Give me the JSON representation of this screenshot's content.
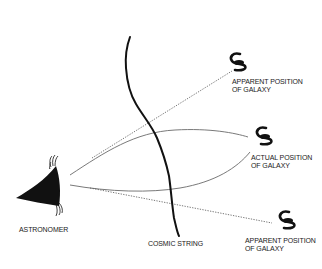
{
  "diagram": {
    "type": "gravitational-lensing-by-cosmic-string",
    "colors": {
      "ink": "#111111",
      "light_path": "#666666",
      "dotted": "#555555",
      "background": "#ffffff"
    },
    "labels": {
      "astronomer": "ASTRONOMER",
      "cosmic_string": "COSMIC STRING",
      "apparent_top": [
        "APPARENT POSITION",
        "OF GALAXY"
      ],
      "actual": [
        "ACTUAL POSITION",
        "OF GALAXY"
      ],
      "apparent_bottom": [
        "APPARENT POSITION",
        "OF GALAXY"
      ]
    },
    "nodes": [
      {
        "id": "astronomer",
        "icon": "eye-cone-icon"
      },
      {
        "id": "cosmic-string",
        "icon": "wavy-line"
      },
      {
        "id": "galaxy-apparent-top",
        "icon": "spiral-galaxy-icon"
      },
      {
        "id": "galaxy-actual",
        "icon": "spiral-galaxy-icon"
      },
      {
        "id": "galaxy-apparent-bottom",
        "icon": "spiral-galaxy-icon"
      }
    ],
    "edges": [
      {
        "from": "astronomer",
        "to": "galaxy-actual",
        "style": "solid-curve",
        "path": "upper"
      },
      {
        "from": "astronomer",
        "to": "galaxy-actual",
        "style": "solid-curve",
        "path": "lower"
      },
      {
        "from": "astronomer",
        "to": "galaxy-apparent-top",
        "style": "dotted"
      },
      {
        "from": "astronomer",
        "to": "galaxy-apparent-bottom",
        "style": "dotted"
      }
    ]
  }
}
